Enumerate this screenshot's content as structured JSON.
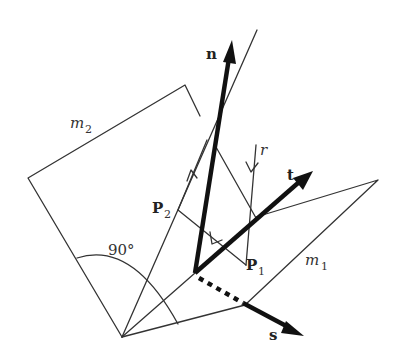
{
  "diagram": {
    "planes": [
      {
        "name": "m",
        "subscript": "2"
      },
      {
        "name": "m",
        "subscript": "1"
      }
    ],
    "vectors": {
      "n": "n",
      "t": "t",
      "s": "s"
    },
    "points": [
      {
        "name": "P",
        "subscript": "2"
      },
      {
        "name": "P",
        "subscript": "1"
      }
    ],
    "ray_label": "r",
    "angle_label": "90°",
    "colors": {
      "line": "#333333",
      "vector": "#111111",
      "background": "#ffffff"
    }
  }
}
